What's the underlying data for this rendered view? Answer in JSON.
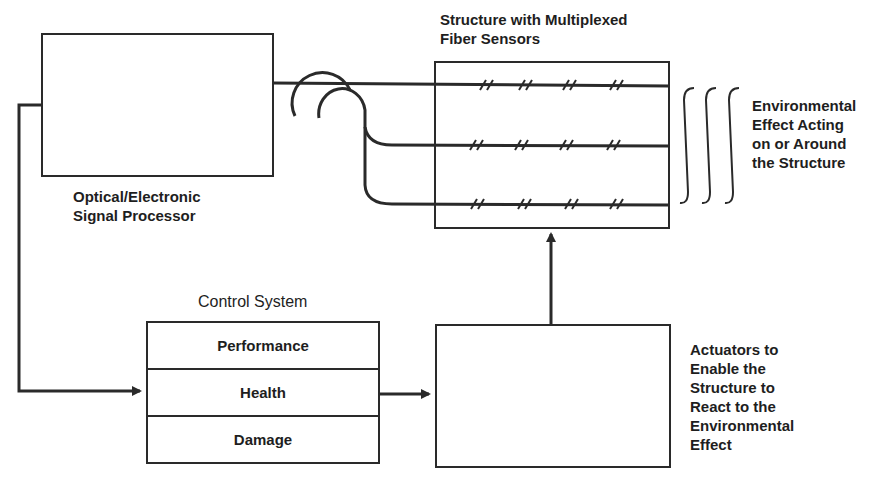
{
  "diagram": {
    "signal_processor": {
      "label_lines": [
        "Optical/Electronic",
        "Signal Processor"
      ]
    },
    "structure": {
      "label_lines": [
        "Structure with Multiplexed",
        "Fiber Sensors"
      ],
      "fiber_count": 3,
      "sensors_per_fiber": 4
    },
    "environment": {
      "label_lines": [
        "Environmental",
        "Effect Acting",
        "on or Around",
        "the Structure"
      ]
    },
    "control_system": {
      "title": "Control System",
      "rows": [
        "Performance",
        "Health",
        "Damage"
      ]
    },
    "actuators": {
      "label_lines": [
        "Actuators to",
        "Enable the",
        "Structure to",
        "React to the",
        "Environmental",
        "Effect"
      ]
    },
    "colors": {
      "line": "#2a2a2a",
      "text": "#1e1e1e",
      "background": "#ffffff"
    }
  }
}
